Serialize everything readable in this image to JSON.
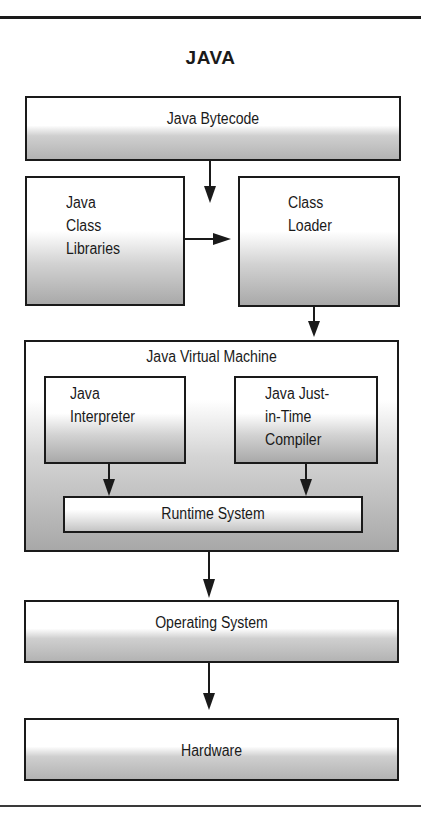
{
  "diagram": {
    "title": "JAVA",
    "nodes": {
      "bytecode": {
        "label": "Java Bytecode"
      },
      "class_libraries": {
        "lines": [
          "Java",
          "Class",
          "Libraries"
        ]
      },
      "class_loader": {
        "lines": [
          "Class",
          "Loader"
        ]
      },
      "jvm": {
        "label": "Java Virtual Machine"
      },
      "interpreter": {
        "lines": [
          "Java",
          "Interpreter"
        ]
      },
      "jit_compiler": {
        "lines": [
          "Java Just-",
          "in-Time",
          "Compiler"
        ]
      },
      "runtime_system": {
        "label": "Runtime System"
      },
      "operating_system": {
        "label": "Operating System"
      },
      "hardware": {
        "label": "Hardware"
      }
    },
    "edges": [
      {
        "from": "Java Bytecode",
        "to": "Class Loader"
      },
      {
        "from": "Java Class Libraries",
        "to": "Class Loader"
      },
      {
        "from": "Class Loader",
        "to": "Java Virtual Machine"
      },
      {
        "from": "Java Interpreter",
        "to": "Runtime System"
      },
      {
        "from": "Java Just-in-Time Compiler",
        "to": "Runtime System"
      },
      {
        "from": "Java Virtual Machine",
        "to": "Operating System"
      },
      {
        "from": "Operating System",
        "to": "Hardware"
      }
    ],
    "colors": {
      "stroke": "#1a1a1a",
      "fill_top": "#ffffff",
      "fill_bottom": "#a9a9a9"
    }
  }
}
